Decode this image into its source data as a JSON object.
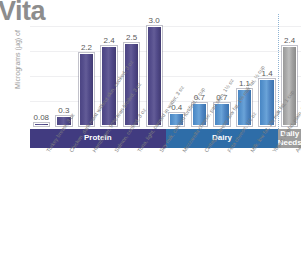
{
  "chart_data": {
    "type": "bar",
    "title_visible": "Vita",
    "ylabel": "Micrograms (µg) of",
    "xlabel": "",
    "ylim": [
      0,
      3.3
    ],
    "grid": true,
    "gridlines": [
      0.75,
      1.5,
      2.25,
      3.0
    ],
    "legend_position": "none",
    "categories": [
      "Turkey breast, 3 oz",
      "Chicken, dark meat without skin, cooked, 3 oz",
      "Hamburger, 90% lean broiled, 3 oz",
      "Salmon, cooked, 3 oz",
      "Tuna, light, canned in water, 3 oz",
      "Soy milk, calcium fortified, 1 cup",
      "Mozzarella cheese, part skim, 1½ oz",
      "Cottage cheese, low fat, 1% milk fat, ½ cup",
      "Feta cheese, 1½ oz",
      "Milk, low fat, 1% milk fat, 1 cup",
      "Yogurt, nonfat, plain, 8 oz",
      "Adults 19 to 50 years"
    ],
    "values": [
      0.08,
      0.3,
      2.2,
      2.4,
      2.5,
      3.0,
      0.4,
      0.7,
      0.7,
      1.1,
      1.4,
      2.4
    ],
    "value_labels": [
      "0.08",
      "0.3",
      "2.2",
      "2.4",
      "2.5",
      "3.0",
      "0.4",
      "0.7",
      "0.7",
      "1.1",
      "1.4",
      "2.4"
    ],
    "groups": [
      {
        "label": "Protein",
        "count": 6,
        "color": "#413b80",
        "bar_class": "protein"
      },
      {
        "label": "Dairy",
        "count": 5,
        "color": "#2e6da8",
        "bar_class": "dairy"
      },
      {
        "label": "Daily Needs",
        "count": 1,
        "color": "#9d9d9d",
        "bar_class": "needs"
      }
    ],
    "separator_after_index": 10
  },
  "colors": {
    "protein": "#413b80",
    "dairy": "#2e6da8",
    "daily_needs": "#9d9d9d",
    "gridline": "#efeff1",
    "label_text": "#7e7e7e",
    "value_text": "#5a5a5a",
    "title_text": "#8d8d8d"
  }
}
